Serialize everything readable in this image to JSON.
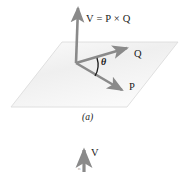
{
  "figure": {
    "type": "vector-cross-product-diagram",
    "caption_a": "(a)",
    "labels": {
      "resultant": "V = P × Q",
      "vector_q": "Q",
      "vector_p": "P",
      "angle": "θ",
      "bottom_vector": "V",
      "bottom_subscript": "n"
    },
    "colors": {
      "vector_stroke": "#8a8a8a",
      "plane_fill": "#f2f2f2",
      "plane_edge": "#d8d8d8",
      "text": "#1a1a1a"
    },
    "geometry": {
      "plane_points": "62,42 178,42 127,107 11,107",
      "origin": {
        "x": 76,
        "y": 63
      },
      "v_tip": {
        "x": 78,
        "y": 3
      },
      "q_tip": {
        "x": 131,
        "y": 46
      },
      "p_tip": {
        "x": 126,
        "y": 93
      },
      "bottom_arrow": {
        "x": 84,
        "y_tip": 146,
        "y_tail": 172
      }
    }
  }
}
